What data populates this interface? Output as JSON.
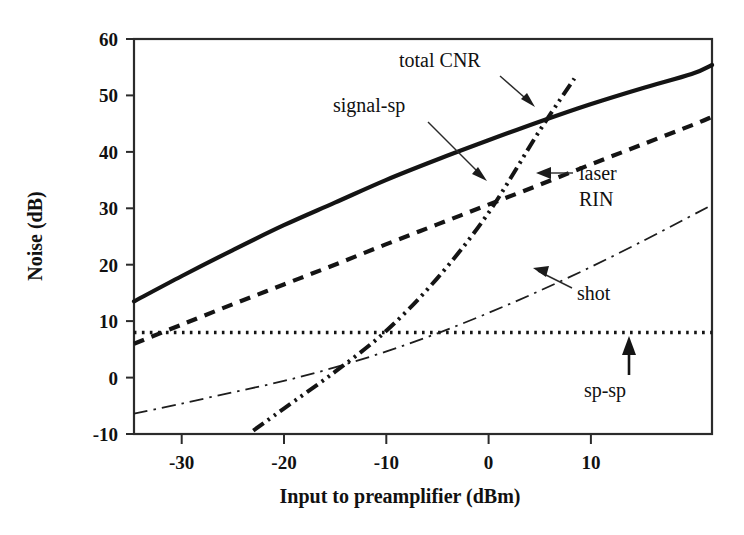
{
  "chart_data": {
    "type": "line",
    "title": "",
    "xlabel": "Input to preamplifier (dBm)",
    "ylabel": "Noise (dB)",
    "xlim": [
      -34.7,
      22.0
    ],
    "ylim": [
      -10,
      60
    ],
    "xticks": [
      -30,
      -20,
      -10,
      0,
      10
    ],
    "xtick_labels": [
      "-30",
      "-20",
      "-10",
      "0",
      "10"
    ],
    "yticks": [
      -10,
      0,
      10,
      20,
      30,
      40,
      50,
      60
    ],
    "ytick_labels": [
      "-10",
      "0",
      "10",
      "20",
      "30",
      "40",
      "50",
      "60"
    ],
    "grid": false,
    "legend_position": "inline-annotations",
    "series": [
      {
        "name": "total CNR",
        "style": "solid-thick",
        "x": [
          -34.7,
          -30,
          -25,
          -20,
          -15,
          -10,
          -5,
          0,
          5,
          10,
          15,
          20,
          22
        ],
        "y": [
          13.5,
          18.0,
          22.6,
          27.0,
          31.0,
          35.0,
          38.6,
          42.0,
          45.3,
          48.4,
          51.2,
          53.8,
          55.4
        ]
      },
      {
        "name": "signal-sp",
        "style": "dashed-thick",
        "x": [
          -34.7,
          -30,
          -25,
          -20,
          -15,
          -10,
          -5,
          0,
          5,
          10,
          15,
          20,
          22
        ],
        "y": [
          6.0,
          9.4,
          13.0,
          16.5,
          20.0,
          23.6,
          27.1,
          30.6,
          34.1,
          37.7,
          41.2,
          44.7,
          46.2
        ]
      },
      {
        "name": "laser RIN",
        "style": "dash-dot-dot-thick",
        "x": [
          -23.0,
          -20,
          -15,
          -10,
          -5,
          0,
          5,
          8.5
        ],
        "y": [
          -9.4,
          -5.5,
          1.0,
          8.2,
          17.5,
          29.0,
          43.5,
          53.0
        ]
      },
      {
        "name": "shot",
        "style": "dash-dot-thin",
        "x": [
          -34.7,
          -30,
          -25,
          -20,
          -15,
          -10,
          -5,
          0,
          5,
          10,
          15,
          20,
          22
        ],
        "y": [
          -6.4,
          -4.6,
          -2.6,
          -0.6,
          1.8,
          4.6,
          7.8,
          11.4,
          15.3,
          19.5,
          24.0,
          28.7,
          30.6
        ]
      },
      {
        "name": "sp-sp",
        "style": "dotted",
        "x": [
          -34.7,
          22.0
        ],
        "y": [
          8.0,
          8.0
        ]
      }
    ],
    "annotations": [
      {
        "text": "total CNR",
        "target_series": "total CNR",
        "x": -13.0,
        "y": 56.0
      },
      {
        "text": "signal-sp",
        "target_series": "signal-sp",
        "x": -23.0,
        "y": 46.5
      },
      {
        "text": "laser",
        "target_series": "laser RIN",
        "x": 0.0,
        "y": 33.5
      },
      {
        "text": "RIN",
        "target_series": "laser RIN",
        "x": 0.0,
        "y": 29.0
      },
      {
        "text": "shot",
        "target_series": "shot",
        "x": 4.0,
        "y": 15.0
      },
      {
        "text": "sp-sp",
        "target_series": "sp-sp",
        "x": 4.5,
        "y": -4.0
      }
    ]
  }
}
